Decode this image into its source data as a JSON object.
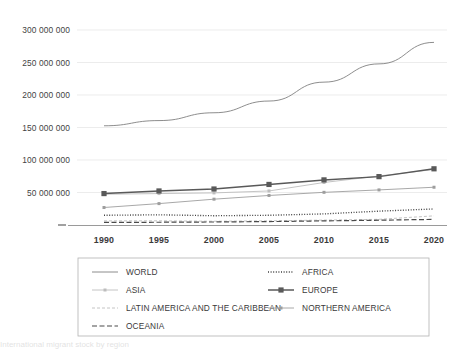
{
  "chart_data": {
    "type": "line",
    "title": "",
    "xlabel": "",
    "ylabel": "",
    "x": [
      1990,
      1995,
      2000,
      2005,
      2010,
      2015,
      2020
    ],
    "categories": [
      "1990",
      "1995",
      "2000",
      "2005",
      "2010",
      "2015",
      "2020"
    ],
    "ylim": [
      0,
      300000000
    ],
    "yticks": [
      0,
      50000000,
      100000000,
      150000000,
      200000000,
      250000000,
      300000000
    ],
    "ytick_labels": [
      "",
      "50 000 000",
      "100 000 000",
      "150 000 000",
      "200 000 000",
      "250 000 000",
      "300 000 000"
    ],
    "grid": true,
    "legend_position": "bottom",
    "series": [
      {
        "name": "WORLD",
        "values": [
          153000000,
          161000000,
          173000000,
          191000000,
          220000000,
          248000000,
          281000000
        ],
        "style": "solid",
        "marker": "none",
        "color": "#808080"
      },
      {
        "name": "AFRICA",
        "values": [
          15700000,
          16400000,
          15000000,
          15700000,
          17800000,
          22000000,
          25400000
        ],
        "style": "dotted",
        "marker": "none",
        "color": "#404040"
      },
      {
        "name": "ASIA",
        "values": [
          48000000,
          49000000,
          50000000,
          53000000,
          66000000,
          76000000,
          86000000
        ],
        "style": "solid",
        "marker": "small",
        "color": "#bdbdbd"
      },
      {
        "name": "EUROPE",
        "values": [
          49000000,
          53000000,
          56000000,
          63000000,
          70000000,
          75000000,
          87000000
        ],
        "style": "solid",
        "marker": "square",
        "color": "#595959"
      },
      {
        "name": "LATIN AMERICA AND THE CARIBBEAN",
        "values": [
          7100000,
          7200000,
          6500000,
          7200000,
          8300000,
          9500000,
          14800000
        ],
        "style": "dashed-light",
        "marker": "none",
        "color": "#c4c4c4"
      },
      {
        "name": "NORTHERN AMERICA",
        "values": [
          27600000,
          33600000,
          40400000,
          46100000,
          50900000,
          54600000,
          58700000
        ],
        "style": "solid",
        "marker": "small",
        "color": "#9e9e9e"
      },
      {
        "name": "OCEANIA",
        "values": [
          4700000,
          5000000,
          5400000,
          6000000,
          7100000,
          8100000,
          9400000
        ],
        "style": "dashed-dark",
        "marker": "none",
        "color": "#4a4a4a"
      }
    ]
  },
  "axis": {
    "ytick_labels": [
      "300 000 000",
      "250 000 000",
      "200 000 000",
      "150 000 000",
      "100 000 000",
      "50 000 000"
    ],
    "xtick_labels": [
      "1990",
      "1995",
      "2000",
      "2005",
      "2010",
      "2015",
      "2020"
    ],
    "origin_tick": "–"
  },
  "legend": {
    "entries": [
      {
        "label": "WORLD",
        "key": "world"
      },
      {
        "label": "AFRICA",
        "key": "africa"
      },
      {
        "label": "ASIA",
        "key": "asia"
      },
      {
        "label": "EUROPE",
        "key": "europe"
      },
      {
        "label": "LATIN AMERICA AND THE CARIBBEAN",
        "key": "latin-america"
      },
      {
        "label": "NORTHERN AMERICA",
        "key": "northern-america"
      },
      {
        "label": "OCEANIA",
        "key": "oceania"
      }
    ]
  },
  "caption": {
    "text": "International migrant stock by region"
  }
}
